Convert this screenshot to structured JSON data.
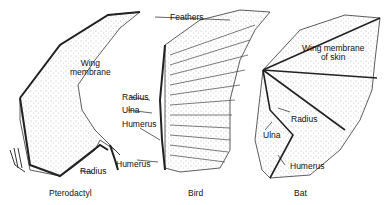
{
  "figure": {
    "panels": [
      {
        "caption": "Pterodactyl",
        "labels": [
          "Wing membrane",
          "Radius",
          "Humerus"
        ]
      },
      {
        "caption": "Bird",
        "labels": [
          "Feathers",
          "Radius",
          "Ulna",
          "Humerus"
        ]
      },
      {
        "caption": "Bat",
        "labels": [
          "Wing membrane of skin",
          "Radius",
          "Ulna",
          "Humerus"
        ]
      }
    ]
  },
  "labels": {
    "ptero_wing1": "Wing",
    "ptero_wing2": "membrane",
    "ptero_radius": "Radius",
    "ptero_humerus": "Humerus",
    "bird_feathers": "Feathers",
    "bird_radius": "Radius",
    "bird_ulna": "Ulna",
    "bird_humerus": "Humerus",
    "bat_wing1": "Wing membrane",
    "bat_wing2": "of skin",
    "bat_radius": "Radius",
    "bat_ulna": "Ulna",
    "bat_humerus": "Humerus"
  },
  "captions": {
    "pterodactyl": "Pterodactyl",
    "bird": "Bird",
    "bat": "Bat"
  }
}
